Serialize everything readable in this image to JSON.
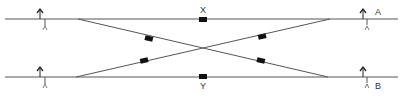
{
  "diagram": {
    "type": "railway-crossover-schematic",
    "colors": {
      "track": "#555555",
      "marker": "#111111",
      "signal": "#222222",
      "label": "#333333"
    },
    "tracks": [
      {
        "id": "A",
        "label": "A",
        "y": 19,
        "x1": 5,
        "x2": 398
      },
      {
        "id": "B",
        "label": "B",
        "y": 77,
        "x1": 5,
        "x2": 398
      }
    ],
    "crossover": {
      "diagonals": [
        {
          "from": [
            78,
            19
          ],
          "to": [
            328,
            77
          ]
        },
        {
          "from": [
            76,
            77
          ],
          "to": [
            330,
            19
          ]
        }
      ]
    },
    "markers": [
      {
        "id": "X",
        "label": "X",
        "x": 203,
        "y": 19
      },
      {
        "id": "Y",
        "label": "Y",
        "x": 203,
        "y": 77
      },
      {
        "id": "d1",
        "x": 149,
        "y": 38
      },
      {
        "id": "d2",
        "x": 144,
        "y": 60
      },
      {
        "id": "d3",
        "x": 262,
        "y": 36
      },
      {
        "id": "d4",
        "x": 261,
        "y": 60
      }
    ],
    "labels": {
      "x": "X",
      "y": "Y",
      "a": "A",
      "b": "B"
    },
    "signals": [
      {
        "id": "sig-left-a",
        "track": "A",
        "x": 40,
        "y": 19
      },
      {
        "id": "sig-left-b",
        "track": "B",
        "x": 40,
        "y": 77
      },
      {
        "id": "sig-right-a",
        "track": "A",
        "x": 365,
        "y": 19
      },
      {
        "id": "sig-right-b",
        "track": "B",
        "x": 365,
        "y": 77
      }
    ]
  }
}
